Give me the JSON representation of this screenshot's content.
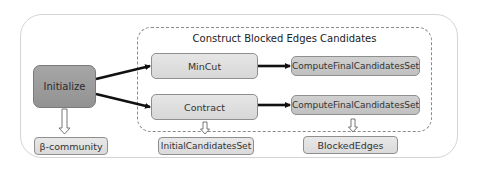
{
  "diagram": {
    "group_title": "Construct Blocked Edges Candidates",
    "nodes": {
      "initialize": "Initialize",
      "mincut": "MinCut",
      "contract": "Contract",
      "compute_final_1": "ComputeFinalCandidatesSet",
      "compute_final_2": "ComputeFinalCandidatesSet",
      "beta_community": "β-community",
      "initial_candidates_set": "InitialCandidatesSet",
      "blocked_edges": "BlockedEdges"
    },
    "edges": [
      {
        "from": "Initialize",
        "to": "MinCut",
        "style": "thick-arrow"
      },
      {
        "from": "Initialize",
        "to": "Contract",
        "style": "thick-arrow"
      },
      {
        "from": "MinCut",
        "to": "ComputeFinalCandidatesSet",
        "style": "thick-arrow"
      },
      {
        "from": "Contract",
        "to": "ComputeFinalCandidatesSet",
        "style": "thick-arrow"
      },
      {
        "from": "Initialize",
        "to": "β-community",
        "style": "hollow-down-arrow"
      },
      {
        "from": "Contract",
        "to": "InitialCandidatesSet",
        "style": "hollow-down-arrow"
      },
      {
        "from": "ComputeFinalCandidatesSet",
        "to": "BlockedEdges",
        "style": "hollow-down-arrow"
      }
    ],
    "colors": {
      "initialize_fill": "#9c9c9c",
      "process_fill": "#dcdcdc",
      "compute_fill": "#c6c6c6",
      "output_fill": "#e0e0e0",
      "arrow": "#111111"
    }
  }
}
